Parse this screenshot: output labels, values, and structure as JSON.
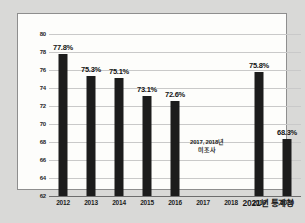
{
  "chart_data": {
    "type": "bar",
    "title": "",
    "xlabel": "",
    "ylabel": "",
    "ylim": [
      62,
      80
    ],
    "ytick_values": [
      80,
      78,
      76,
      74,
      72,
      70,
      68,
      66,
      64,
      62
    ],
    "yticks": [
      "80",
      "78",
      "76",
      "74",
      "72",
      "70",
      "68",
      "66",
      "64",
      "62"
    ],
    "grid": true,
    "legend": "none",
    "categories": [
      "2012",
      "2013",
      "2014",
      "2015",
      "2016",
      "2017",
      "2018",
      "2019",
      "2020"
    ],
    "values": [
      77.8,
      75.3,
      75.1,
      73.1,
      72.6,
      null,
      null,
      75.8,
      68.3
    ],
    "data_labels": [
      "77.8%",
      "75.3%",
      "75.1%",
      "73.1%",
      "72.6%",
      "",
      "",
      "75.8%",
      "68.3%"
    ],
    "bar_color": "#1c1c1c",
    "annotations": [
      {
        "line1": "2017, 2018년",
        "line2": "미조사",
        "x_category": "2017",
        "y_value": 68.5
      }
    ]
  },
  "footer": {
    "source": "2021년 통계청"
  },
  "colors": {
    "page_background": "#d9d9d7",
    "plot_background": "#fdfdfb",
    "frame_border": "#8e8e8e",
    "gridline": "#c9c9c9",
    "axis": "#6d6d6d",
    "text": "#1a1a1a"
  }
}
